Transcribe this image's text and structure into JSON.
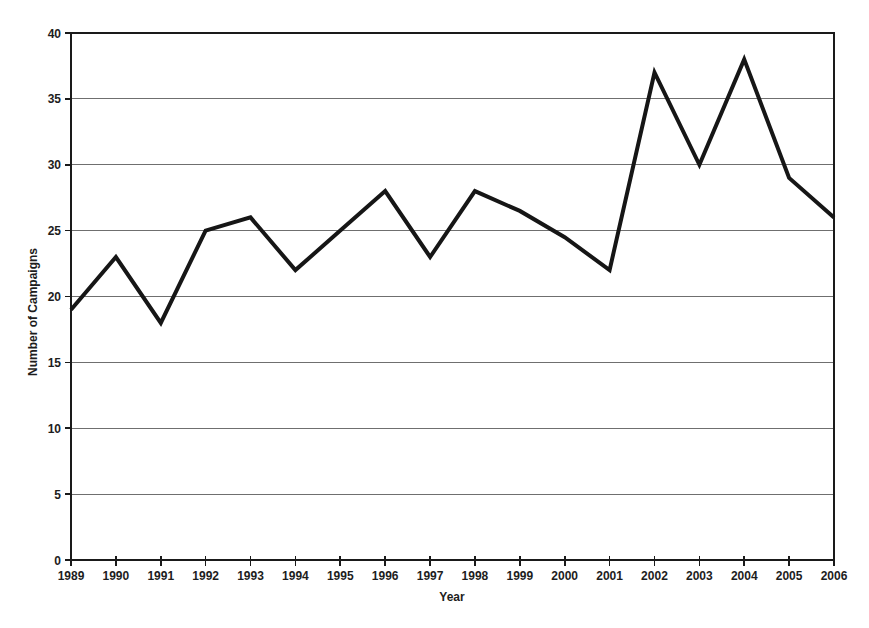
{
  "chart_data": {
    "type": "line",
    "title": "",
    "xlabel": "Year",
    "ylabel": "Number of Campaigns",
    "x": [
      1989,
      1990,
      1991,
      1992,
      1993,
      1994,
      1995,
      1996,
      1997,
      1998,
      1999,
      2000,
      2001,
      2002,
      2003,
      2004,
      2005,
      2006
    ],
    "series": [
      {
        "name": "Number of Campaigns",
        "values": [
          19,
          23,
          18,
          25,
          26,
          22,
          25,
          28,
          23,
          28,
          26.5,
          24.5,
          22,
          37,
          30,
          38,
          29,
          26
        ]
      }
    ],
    "ylim": [
      0,
      40
    ],
    "ytick_step": 5,
    "grid": "horizontal",
    "legend": "none",
    "style": {
      "line_color": "#161616",
      "line_width": 4,
      "grid_color": "#6f6f6f",
      "axis_color": "#1a1a1a",
      "text_color": "#1d1d1d",
      "background": "#ffffff"
    }
  }
}
